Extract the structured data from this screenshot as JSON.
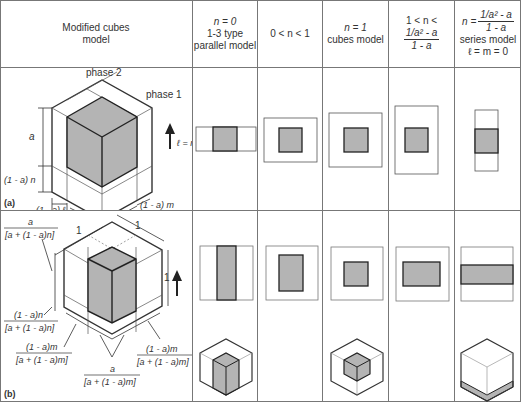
{
  "table": {
    "header": {
      "model_col": "Modified cubes model",
      "columns": [
        {
          "line1": "n = 0",
          "line2": "1-3 type",
          "line3": "parallel model"
        },
        {
          "line1": "0 < n < 1"
        },
        {
          "line1": "n = 1",
          "line2": "cubes model"
        },
        {
          "line1": "1 < n <",
          "frac_num": "1/a² - a",
          "frac_den": "1 - a"
        },
        {
          "line1": "n =",
          "frac_num": "1/a² - a",
          "frac_den": "1 - a",
          "line2": "series model",
          "line3": "ℓ = m = 0"
        }
      ]
    },
    "row_a": {
      "label": "(a)",
      "phase2": "phase 2",
      "phase1": "phase 1",
      "arrow_label": "ℓ = m",
      "dim_a_vertical": "a",
      "dim_n": "(1 - a) n",
      "dim_l": "(1 - a) ℓ",
      "dim_a_left": "a",
      "dim_a_right": "a",
      "dim_m": "(1 - a) m"
    },
    "row_b": {
      "label": "(b)",
      "dim_one_left": "1",
      "dim_one_right": "1",
      "dim_one_vertical": "1",
      "frac_top_num": "a",
      "frac_top_den": "[a + (1 - a)n]",
      "frac_n_num": "(1 - a)n",
      "frac_n_den": "[a + (1 - a)n]",
      "frac_m_left_num": "(1 - a)m",
      "frac_m_left_den": "[a + (1 - a)m]",
      "frac_a_num": "a",
      "frac_a_den": "[a + (1 - a)m]",
      "frac_m_right_num": "(1 - a)m",
      "frac_m_right_den": "[a + (1 - a)m]"
    }
  },
  "colors": {
    "grid": "#777777",
    "phase1_fill": "#b4b4b4",
    "line": "#333333",
    "background": "#ffffff"
  }
}
